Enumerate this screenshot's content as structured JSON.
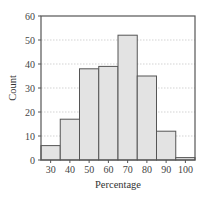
{
  "chart_data": {
    "type": "bar",
    "title": "",
    "xlabel": "Percentage",
    "ylabel": "Count",
    "categories": [
      "30",
      "40",
      "50",
      "60",
      "70",
      "80",
      "90",
      "100"
    ],
    "values": [
      6,
      17,
      38,
      39,
      52,
      35,
      12,
      1
    ],
    "ylim": [
      0,
      60
    ],
    "yticks": [
      0,
      10,
      20,
      30,
      40,
      50,
      60
    ],
    "grid": "horizontal dotted",
    "legend": null,
    "colors": {
      "bar_fill": "#e3e3e3",
      "bar_edge": "#555555",
      "axis": "#555555",
      "grid": "#c8c8c8"
    }
  }
}
